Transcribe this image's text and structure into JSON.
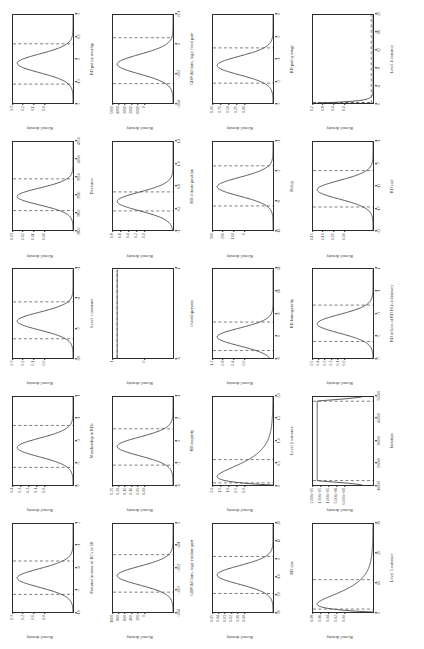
{
  "figure": {
    "type": "kernel-density-panel-grid",
    "rows": 4,
    "cols": 5,
    "orientation": "page rotated 90 degrees (landscape figure on portrait page)",
    "y_axis_label": "Kernel density",
    "ci_line_style": "dashed vertical lines marking 95% credible interval bounds"
  },
  "chart_data": [
    {
      "type": "line",
      "id": "p1",
      "title": "",
      "xlabel": "Personal income of HCs in 50",
      "ylabel": "Kernel density",
      "xlim": [
        -10,
        4
      ],
      "ylim": [
        0,
        0.3
      ],
      "xticks": [
        "-10",
        "-7",
        "-4",
        "-1",
        "2"
      ],
      "yticks": [
        "0.0",
        "0.1",
        "0.2",
        "0.3"
      ],
      "peak_x": -4.6,
      "ci": [
        -7.2,
        -1.9
      ],
      "shape": "unimodal-normal",
      "sd_frac": 0.105
    },
    {
      "type": "line",
      "id": "p2",
      "xlabel": "Membership in RDs",
      "ylabel": "Kernel density",
      "xlim": [
        -7,
        1
      ],
      "ylim": [
        0,
        0.4
      ],
      "xticks": [
        "-7",
        "-5",
        "-3",
        "-1",
        "1"
      ],
      "yticks": [
        "0.0",
        "0.1",
        "0.2",
        "0.3",
        "0.4"
      ],
      "peak_x": -3.6,
      "ci": [
        -5.4,
        -1.6
      ],
      "shape": "unimodal-normal",
      "sd_frac": 0.105
    },
    {
      "type": "line",
      "id": "p3",
      "xlabel": "Level 1 constant",
      "ylabel": "Kernel density",
      "xlim": [
        -10,
        1
      ],
      "ylim": [
        0,
        0.3
      ],
      "xticks": [
        "-10",
        "-7",
        "-4",
        "-1"
      ],
      "yticks": [
        "0.0",
        "0.1",
        "0.2",
        "0.3"
      ],
      "peak_x": -5.4,
      "ci": [
        -7.6,
        -3.0
      ],
      "shape": "unimodal-normal",
      "sd_frac": 0.1
    },
    {
      "type": "line",
      "id": "p4",
      "xlabel": "Deviance",
      "ylabel": "Kernel density",
      "xlim": [
        3800,
        4050
      ],
      "ylim": [
        0,
        0.03
      ],
      "xticks": [
        "3800",
        "3850",
        "3900",
        "3950",
        "4000",
        "4050"
      ],
      "yticks": [
        "0.00",
        "0.01",
        "0.02",
        "0.03"
      ],
      "peak_x": 3895,
      "ci": [
        3855,
        3945
      ],
      "shape": "unimodal-normal",
      "sd_frac": 0.095
    },
    {
      "type": "line",
      "id": "p5",
      "xlabel": "RD policy overlap",
      "ylabel": "Kernel density",
      "xlim": [
        -3,
        4
      ],
      "ylim": [
        0,
        0.3
      ],
      "xticks": [
        "-3",
        "-1.5",
        "0",
        "1.5",
        "3"
      ],
      "yticks": [
        "0.0",
        "0.1",
        "0.2",
        "0.3"
      ],
      "peak_x": 0.15,
      "ci": [
        -1.5,
        1.7
      ],
      "shape": "unimodal-normal",
      "sd_frac": 0.105
    },
    {
      "type": "line",
      "id": "p6",
      "xlabel": "GDP (billions, log): random part",
      "ylabel": "Kernel density",
      "xlim": [
        -0.004,
        0
      ],
      "ylim": [
        0,
        1000
      ],
      "xticks": [
        "-.004",
        "-.003",
        "-.002",
        "-.001",
        "0"
      ],
      "yticks": [
        "0",
        "200",
        "400",
        "600",
        "800",
        "1000"
      ],
      "peak_x": -0.00235,
      "ci": [
        -0.0031,
        -0.0014
      ],
      "shape": "unimodal-normal",
      "sd_frac": 0.105
    },
    {
      "type": "line",
      "id": "p7",
      "xlabel": "RD majority",
      "ylabel": "Kernel density",
      "xlim": [
        -4,
        4
      ],
      "ylim": [
        0,
        0.25
      ],
      "xticks": [
        "-4",
        "-2",
        "0",
        "2",
        "4"
      ],
      "yticks": [
        "0.00",
        "0.05",
        "0.10",
        "0.15",
        "0.20",
        "0.25"
      ],
      "peak_x": -0.5,
      "ci": [
        -2.2,
        1.1
      ],
      "shape": "unimodal-normal",
      "sd_frac": 0.105
    },
    {
      "type": "line",
      "id": "p8",
      "xlabel": "Overdispersion",
      "ylabel": "Kernel density",
      "xlim": [
        -1,
        1
      ],
      "ylim": [
        0,
        1
      ],
      "xticks": [
        "-1",
        "1"
      ],
      "yticks": [
        "0",
        "1"
      ],
      "peak_x": 0,
      "ci": [
        null,
        null
      ],
      "shape": "degenerate-flat-top",
      "sd_frac": 0.0
    },
    {
      "type": "line",
      "id": "p9",
      "xlabel": "RD climate position",
      "ylabel": "Kernel density",
      "xlim": [
        -1,
        4
      ],
      "ylim": [
        0,
        0.8
      ],
      "xticks": [
        "-1",
        "0.2",
        "0.6",
        "1.0",
        "1.4"
      ],
      "yticks": [
        "0.0",
        "0.2",
        "0.4",
        "0.6",
        "0.8"
      ],
      "peak_x": 0.62,
      "ci": [
        0.08,
        1.16
      ],
      "shape": "unimodal-normal",
      "sd_frac": 0.105
    },
    {
      "type": "line",
      "id": "p10",
      "xlabel": "GDP (billions, log): fixed part",
      "ylabel": "Kernel density",
      "xlim": [
        -0.004,
        0.001
      ],
      "ylim": [
        0,
        5000
      ],
      "xticks": [
        "-.004",
        "-.002",
        "0",
        ".001"
      ],
      "yticks": [
        "0",
        "1000",
        "2000",
        "3000",
        "4000",
        "5000"
      ],
      "peak_x": -0.0018,
      "ci": [
        -0.0029,
        -0.0003
      ],
      "shape": "unimodal-normal",
      "sd_frac": 0.11
    },
    {
      "type": "line",
      "id": "p11",
      "xlabel": "RD size",
      "ylabel": "Kernel density",
      "xlim": [
        -30,
        20
      ],
      "ylim": [
        0,
        0.05
      ],
      "xticks": [
        "-30",
        "-20",
        "-10",
        "0",
        "10",
        "20"
      ],
      "yticks": [
        "0.00",
        "0.01",
        "0.02",
        "0.03",
        "0.04",
        "0.05"
      ],
      "peak_x": -9.0,
      "ci": [
        -19.5,
        1.5
      ],
      "shape": "unimodal-normal",
      "sd_frac": 0.105
    },
    {
      "type": "line",
      "id": "p12",
      "xlabel": "Level 2 variance",
      "ylabel": "Kernel density",
      "xlim": [
        0,
        2.5
      ],
      "ylim": [
        0,
        2
      ],
      "xticks": [
        "0",
        "0.5",
        "1.0",
        "1.5",
        "2.0"
      ],
      "yticks": [
        "0.0",
        "0.5",
        "1.0",
        "1.5",
        "2.0"
      ],
      "peak_x": 0.3,
      "ci": [
        0.06,
        0.72
      ],
      "shape": "right-skewed",
      "sd_frac": 0.085
    },
    {
      "type": "line",
      "id": "p13",
      "xlabel": "RD homogeneity",
      "ylabel": "Kernel density",
      "xlim": [
        -1,
        25
      ],
      "ylim": [
        0,
        1.2
      ],
      "xticks": [
        "-1",
        "0",
        "8",
        "16",
        "24"
      ],
      "yticks": [
        "0.0",
        "0.4",
        "0.8",
        "1.2"
      ],
      "peak_x": 5.2,
      "ci": [
        1.2,
        9.6
      ],
      "shape": "unimodal-normal",
      "sd_frac": 0.1
    },
    {
      "type": "line",
      "id": "p14",
      "xlabel": "Policy",
      "ylabel": "Kernel density",
      "xlim": [
        -10,
        1
      ],
      "ylim": [
        0,
        300
      ],
      "xticks": [
        "-10",
        "-6",
        "-2",
        ".1"
      ],
      "yticks": [
        "0",
        "100",
        "200",
        "300"
      ],
      "peak_x": -4.6,
      "ci": [
        -7.0,
        -2.0
      ],
      "shape": "unimodal-normal",
      "sd_frac": 0.105
    },
    {
      "type": "line",
      "id": "p15",
      "xlabel": "RD policy range",
      "ylabel": "Kernel density",
      "xlim": [
        -3,
        1
      ],
      "ylim": [
        0,
        1
      ],
      "xticks": [
        "-3",
        "-2",
        "-1",
        "0",
        "1"
      ],
      "yticks": [
        "0.00",
        "0.25",
        "0.50",
        "0.75",
        "1.00"
      ],
      "peak_x": -1.3,
      "ci": [
        -2.1,
        -0.5
      ],
      "shape": "unimodal-normal",
      "sd_frac": 0.105
    },
    {
      "type": "line",
      "id": "p16",
      "xlabel": "Level 3 variance",
      "ylabel": "Kernel density",
      "xlim": [
        0,
        30
      ],
      "ylim": [
        0,
        0.08
      ],
      "xticks": [
        "0",
        "10",
        "20",
        "30"
      ],
      "yticks": [
        "0.00",
        "0.02",
        "0.04",
        "0.06",
        "0.08"
      ],
      "peak_x": 4.0,
      "ci": [
        1.0,
        11.0
      ],
      "shape": "right-skewed",
      "sd_frac": 0.08
    },
    {
      "type": "line",
      "id": "p17",
      "xlabel": "Iteration",
      "ylabel": "Kernel density",
      "xlim": [
        10000,
        50000
      ],
      "ylim": [
        0,
        2.5e-05
      ],
      "xticks": [
        "10000",
        "20000",
        "30000",
        "40000",
        "50000"
      ],
      "yticks": [
        "0.000e+00",
        "5.000e-06",
        "1.000e-05",
        "1.500e-05",
        "2.000e-05"
      ],
      "peak_x": 30000,
      "ci": [
        12000,
        48000
      ],
      "shape": "uniform-plateau",
      "sd_frac": 0.0
    },
    {
      "type": "line",
      "id": "p18",
      "xlabel": "RD offices at RD HQs (distance)",
      "ylabel": "Kernel density",
      "xlim": [
        -7,
        1
      ],
      "ylim": [
        0,
        0.5
      ],
      "xticks": [
        "-7",
        "-5",
        "-3",
        "-1",
        "1"
      ],
      "yticks": [
        "0.0",
        "0.1",
        "0.2",
        "0.3",
        "0.4",
        "0.5"
      ],
      "peak_x": -3.9,
      "ci": [
        -5.5,
        -2.2
      ],
      "shape": "unimodal-normal",
      "sd_frac": 0.105
    },
    {
      "type": "line",
      "id": "p19",
      "xlabel": "RD size",
      "ylabel": "Kernel density",
      "xlim": [
        -22,
        1
      ],
      "ylim": [
        0,
        0.15
      ],
      "xticks": [
        "-22",
        "-17",
        "-12",
        "-7",
        "-1"
      ],
      "yticks": [
        "0.00",
        "0.05",
        "0.10",
        "0.15"
      ],
      "peak_x": -11.5,
      "ci": [
        -16.0,
        -6.5
      ],
      "shape": "unimodal-normal",
      "sd_frac": 0.105
    },
    {
      "type": "line",
      "id": "p20",
      "xlabel": "Level 4 variance",
      "ylabel": "Kernel density",
      "xlim": [
        0,
        20
      ],
      "ylim": [
        0,
        1.2
      ],
      "xticks": [
        "0",
        "4",
        "8",
        "12",
        "16",
        "20"
      ],
      "yticks": [
        "0.0",
        "0.4",
        "0.8",
        "1.2"
      ],
      "peak_x": 0.25,
      "ci": [
        0.05,
        0.12
      ],
      "shape": "sharp-right-skewed",
      "sd_frac": 0.02
    }
  ]
}
